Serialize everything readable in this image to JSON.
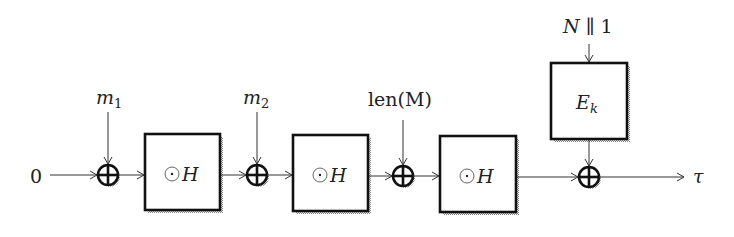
{
  "diagram": {
    "type": "block-diagram",
    "input_label": "0",
    "output_label": "τ",
    "inputs": [
      {
        "label": "m",
        "subscript": "1"
      },
      {
        "label": "m",
        "subscript": "2"
      },
      {
        "label": "len(M)"
      }
    ],
    "hash_blocks": [
      {
        "label": "⊙H"
      },
      {
        "label": "⊙H"
      },
      {
        "label": "⊙H"
      }
    ],
    "encryption_block": {
      "label": "E",
      "subscript": "k"
    },
    "encryption_input": "N ∥ 1",
    "xor_nodes": 4,
    "colors": {
      "stroke": "#111111",
      "text": "#222222",
      "shadow": "#9a9a9a"
    }
  }
}
